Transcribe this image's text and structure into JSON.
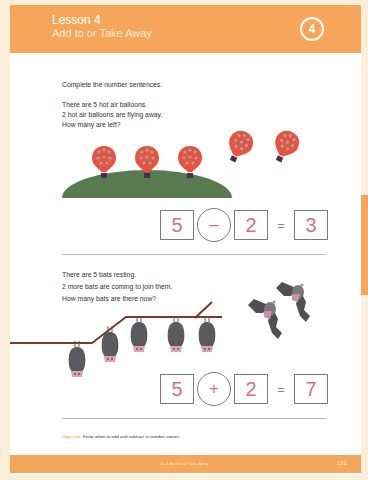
{
  "header": {
    "title": "Lesson 4",
    "subtitle": "Add to or Take Away",
    "lesson_number": "4"
  },
  "instructions": "Complete the number sentences.",
  "problem1": {
    "lines": [
      "There are 5 hot air balloons.",
      "2 hot air balloons are flying away.",
      "How many are left?"
    ],
    "equation": {
      "a": "5",
      "op": "–",
      "b": "2",
      "equals": "=",
      "result": "3"
    }
  },
  "problem2": {
    "lines": [
      "There are 5 bats resting.",
      "2 more bats are coming to join them.",
      "How many bats are there now?"
    ],
    "equation": {
      "a": "5",
      "op": "+",
      "b": "2",
      "equals": "=",
      "result": "7"
    }
  },
  "objective": {
    "label": "Objective:",
    "text": "Know when to add and subtract in number stories."
  },
  "footer": {
    "section": "11.4  Add to or Take Away",
    "page_number": "131"
  },
  "colors": {
    "brand_orange": "#f6a65a",
    "background": "#fbefd9",
    "answer_pink": "#e06a86",
    "balloon_red": "#e8533f",
    "hill_green": "#577a4f",
    "branch_brown": "#7b3a2a",
    "bat_gray": "#5a5a5e"
  }
}
